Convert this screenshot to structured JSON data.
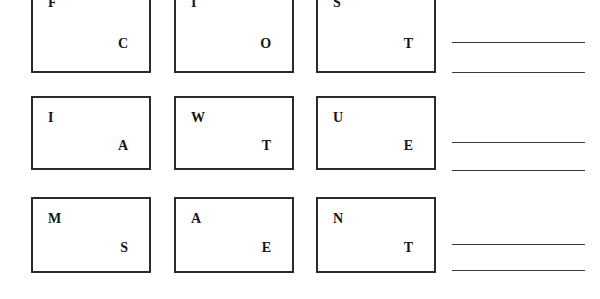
{
  "worksheet": {
    "title": "Letter Card Grid Worksheet",
    "columns": 3,
    "rows": 3,
    "cards": [
      {
        "id": "card-r1c1",
        "top_letter": "F",
        "bottom_letter": "C",
        "row": 1,
        "column": 1,
        "clipped_top": true
      },
      {
        "id": "card-r1c2",
        "top_letter": "I",
        "bottom_letter": "O",
        "row": 1,
        "column": 2,
        "clipped_top": true
      },
      {
        "id": "card-r1c3",
        "top_letter": "S",
        "bottom_letter": "T",
        "row": 1,
        "column": 3,
        "clipped_top": true
      },
      {
        "id": "card-r2c1",
        "top_letter": "I",
        "bottom_letter": "A",
        "row": 2,
        "column": 1,
        "clipped_top": false
      },
      {
        "id": "card-r2c2",
        "top_letter": "W",
        "bottom_letter": "T",
        "row": 2,
        "column": 2,
        "clipped_top": false
      },
      {
        "id": "card-r2c3",
        "top_letter": "U",
        "bottom_letter": "E",
        "row": 2,
        "column": 3,
        "clipped_top": false
      },
      {
        "id": "card-r3c1",
        "top_letter": "M",
        "bottom_letter": "S",
        "row": 3,
        "column": 1,
        "clipped_top": false
      },
      {
        "id": "card-r3c2",
        "top_letter": "A",
        "bottom_letter": "E",
        "row": 3,
        "column": 2,
        "clipped_top": false
      },
      {
        "id": "card-r3c3",
        "top_letter": "N",
        "bottom_letter": "T",
        "row": 3,
        "column": 3,
        "clipped_top": false
      }
    ],
    "answer_lines": [
      {
        "id": "answer-line-1",
        "group": 1,
        "value": ""
      },
      {
        "id": "answer-line-2",
        "group": 1,
        "value": ""
      },
      {
        "id": "answer-line-3",
        "group": 2,
        "value": ""
      },
      {
        "id": "answer-line-4",
        "group": 2,
        "value": ""
      },
      {
        "id": "answer-line-5",
        "group": 3,
        "value": ""
      },
      {
        "id": "answer-line-6",
        "group": 3,
        "value": ""
      }
    ],
    "colors": {
      "page_background": "#ffffff",
      "card_border": "#2b2b2b",
      "letter": "#141414",
      "answer_line": "#3a3a3a"
    }
  }
}
